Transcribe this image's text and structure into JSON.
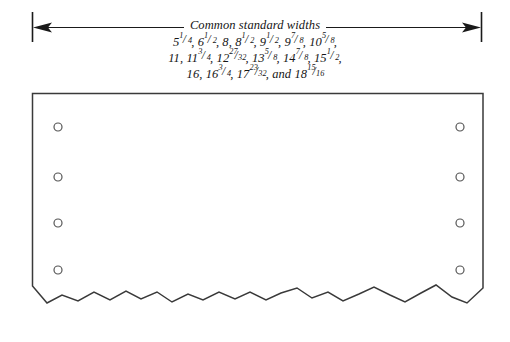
{
  "diagram": {
    "caption_title": "Common standard widths",
    "widths_lines": [
      "5 1/4, 6 1/2, 8, 8 1/2, 9 1/2, 9 7/8, 10 5/8,",
      "11, 11 3/4, 12 27/32, 13 5/8, 14 7/8, 15 1/2,",
      "16, 16 3/4, 17 23/32, and 18 15/16"
    ],
    "widths_line_1": {
      "v1": "5",
      "v1n": "1",
      "v1d": "4",
      "sep1": ", ",
      "v2": "6",
      "v2n": "1",
      "v2d": "2",
      "sep2": ", ",
      "v3": "8",
      "sep3": ", ",
      "v4": "8",
      "v4n": "1",
      "v4d": "2",
      "sep4": ", ",
      "v5": "9",
      "v5n": "1",
      "v5d": "2",
      "sep5": ", ",
      "v6": "9",
      "v6n": "7",
      "v6d": "8",
      "sep6": ", ",
      "v7": "10",
      "v7n": "5",
      "v7d": "8",
      "sep7": ","
    },
    "widths_line_2": {
      "v1": "11",
      "sep1": ", ",
      "v2": "11",
      "v2n": "3",
      "v2d": "4",
      "sep2": ", ",
      "v3": "12",
      "v3n": "27",
      "v3d": "32",
      "sep3": ", ",
      "v4": "13",
      "v4n": "5",
      "v4d": "8",
      "sep4": ", ",
      "v5": "14",
      "v5n": "7",
      "v5d": "8",
      "sep5": ", ",
      "v6": "15",
      "v6n": "1",
      "v6d": "2",
      "sep6": ","
    },
    "widths_line_3": {
      "v1": "16",
      "sep1": ", ",
      "v2": "16",
      "v2n": "3",
      "v2d": "4",
      "sep2": ", ",
      "v3": "17",
      "v3n": "23",
      "v3d": "32",
      "sep3": ", ",
      "conj": "and ",
      "v4": "18",
      "v4n": "15",
      "v4d": "16"
    },
    "colors": {
      "line": "#1a1a1a",
      "board_outline": "#3a3a3a",
      "hole_outline": "#555555",
      "background": "#ffffff",
      "text": "#151515"
    },
    "holes": {
      "count_per_side": 4,
      "left_x": 58,
      "right_x": 460,
      "rows_y": [
        127,
        177,
        223,
        270
      ],
      "radius": 4
    },
    "board": {
      "left": 32,
      "top": 93,
      "right": 483,
      "bottom_nominal": 300
    },
    "dimension_line": {
      "y": 27,
      "left_extension_x": 32,
      "right_extension_x": 481,
      "extension_top": 12,
      "extension_bottom": 42
    },
    "torn_edge_points": "32,286 47,303 62,295 78,301 94,292 110,300 126,291 141,299 157,292 172,302 188,294 203,300 219,292 235,299 250,292 266,300 281,293 297,288 312,298 328,292 343,301 359,294 374,287 390,295 405,302 421,293 436,285 452,297 467,303 483,288"
  }
}
